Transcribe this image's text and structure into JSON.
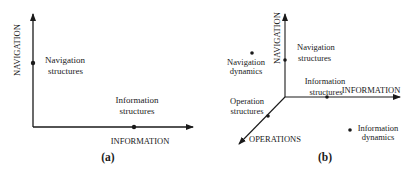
{
  "panels": {
    "a": {
      "caption": "(a)",
      "axes": {
        "vertical": "NAVIGATION",
        "horizontal": "INFORMATION"
      },
      "points": [
        {
          "line1": "Navigation",
          "line2": "structures"
        },
        {
          "line1": "Information",
          "line2": "structures"
        }
      ]
    },
    "b": {
      "caption": "(b)",
      "axes": {
        "vertical": "NAVIGATION",
        "horizontal": "INFORMATION",
        "diagonal": "OPERATIONS"
      },
      "points": [
        {
          "line1": "Navigation",
          "line2": "structures"
        },
        {
          "line1": "Information",
          "line2": "structures"
        },
        {
          "line1": "Operation",
          "line2": "structures"
        },
        {
          "line1": "Navigation",
          "line2": "dynamics"
        },
        {
          "line1": "Information",
          "line2": "dynamics"
        }
      ]
    }
  },
  "colors": {
    "ink": "#1a1a1a",
    "background": "#ffffff"
  }
}
